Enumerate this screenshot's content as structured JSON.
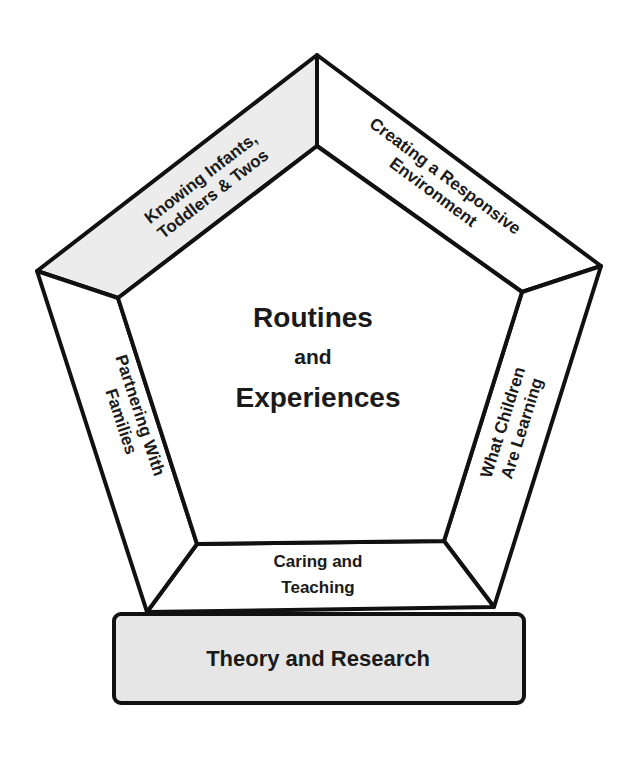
{
  "diagram": {
    "center": {
      "line1": "Routines",
      "line2": "and",
      "line3": "Experiences"
    },
    "panels": {
      "top_left": {
        "line1": "Knowing Infants,",
        "line2": "Toddlers & Twos",
        "fill": "#ececec"
      },
      "top_right": {
        "line1": "Creating a Responsive",
        "line2": "Environment",
        "fill": "#ffffff"
      },
      "right": {
        "line1": "What Children",
        "line2": "Are Learning",
        "fill": "#ffffff"
      },
      "bottom": {
        "line1": "Caring and",
        "line2": "Teaching",
        "fill": "#ffffff"
      },
      "left": {
        "line1": "Partnering With",
        "line2": "Families",
        "fill": "#ffffff"
      }
    },
    "base": {
      "label": "Theory and Research",
      "fill": "#e6e6e6"
    },
    "colors": {
      "stroke": "#111111",
      "text": "#1a1a1a"
    }
  }
}
